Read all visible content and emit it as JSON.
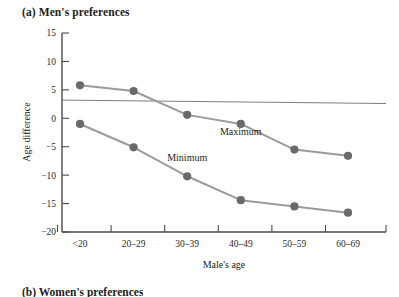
{
  "figure": {
    "panel_label": "(a) Men's preferences",
    "next_panel_label": "(b) Women's preferences"
  },
  "chart_data": {
    "type": "line",
    "title": "(a) Men's preferences",
    "xlabel": "Male's age",
    "ylabel": "Age difference",
    "categories": [
      "<20",
      "20–29",
      "30–39",
      "40–49",
      "50–59",
      "60–69"
    ],
    "ylim": [
      -20,
      15
    ],
    "yticks": [
      15,
      10,
      5,
      0,
      -5,
      -10,
      -15,
      -20
    ],
    "ytick_labels": [
      "15",
      "10",
      "5",
      "0",
      "−5",
      "−10",
      "−15",
      "−20"
    ],
    "grid": false,
    "legend_position": "inline-annotations",
    "series": [
      {
        "name": "Maximum",
        "label": "Maximum",
        "color": "#9b9b9b",
        "marker_color": "#6a6a6a",
        "values": [
          5.8,
          4.8,
          0.6,
          -1.0,
          -5.5,
          -6.6
        ]
      },
      {
        "name": "Minimum",
        "label": "Minimum",
        "color": "#9b9b9b",
        "marker_color": "#6a6a6a",
        "values": [
          -1.0,
          -5.1,
          -10.2,
          -14.4,
          -15.5,
          -16.6
        ]
      }
    ],
    "reference_line": {
      "name": "own-age reference",
      "start_value": 3.2,
      "end_value": 2.6,
      "color": "#6e6e6e"
    },
    "annotations": [
      {
        "text": "Maximum",
        "x_category": "40–49",
        "y_value": -3.0
      },
      {
        "text": "Minimum",
        "x_category": "30–39",
        "y_value": -7.6
      }
    ]
  }
}
